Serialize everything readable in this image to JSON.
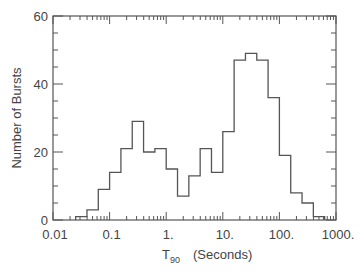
{
  "chart_data": {
    "type": "bar",
    "subtype": "histogram-step",
    "title": "",
    "xlabel": "T90   (Seconds)",
    "xlabel_main": "T",
    "xlabel_sub": "90",
    "xlabel_units": "(Seconds)",
    "ylabel": "Number of Bursts",
    "xscale": "log",
    "xlim": [
      0.01,
      1000
    ],
    "ylim": [
      0,
      60
    ],
    "xticks": [
      "0.01",
      "0.1",
      "1.",
      "10.",
      "100.",
      "1000."
    ],
    "xtick_values": [
      0.01,
      0.1,
      1,
      10,
      100,
      1000
    ],
    "yticks": [
      "0",
      "20",
      "40",
      "60"
    ],
    "ytick_values": [
      0,
      20,
      40,
      60
    ],
    "grid": false,
    "legend": null,
    "bin_width_dex": 0.2,
    "bin_edges_log10": [
      -1.6,
      -1.4,
      -1.2,
      -1.0,
      -0.8,
      -0.6,
      -0.4,
      -0.2,
      0.0,
      0.2,
      0.4,
      0.6,
      0.8,
      1.0,
      1.2,
      1.4,
      1.6,
      1.8,
      2.0,
      2.2,
      2.4,
      2.6,
      2.8
    ],
    "categories": [
      "0.025-0.04",
      "0.04-0.063",
      "0.063-0.1",
      "0.1-0.16",
      "0.16-0.25",
      "0.25-0.4",
      "0.4-0.63",
      "0.63-1",
      "1-1.6",
      "1.6-2.5",
      "2.5-4",
      "4-6.3",
      "6.3-10",
      "10-16",
      "16-25",
      "25-40",
      "40-63",
      "63-100",
      "100-160",
      "160-250",
      "250-400",
      "400-630"
    ],
    "values": [
      1,
      3,
      9,
      14,
      21,
      29,
      20,
      21,
      15,
      7,
      13,
      21,
      14,
      26,
      47,
      49,
      47,
      36,
      19,
      8,
      5,
      1
    ],
    "line_color": "#555555"
  }
}
